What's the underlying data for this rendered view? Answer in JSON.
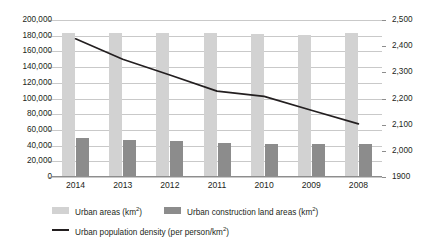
{
  "chart_data": {
    "type": "bar",
    "title": "",
    "xlabel": "",
    "ylabel": "",
    "categories": [
      "2014",
      "2013",
      "2012",
      "2011",
      "2010",
      "2009",
      "2008"
    ],
    "series": [
      {
        "name": "Urban areas (km²)",
        "type": "bar",
        "axis": "left",
        "color": "#d2d2d2",
        "values": [
          183500,
          183500,
          183200,
          183200,
          182600,
          180500,
          183000
        ]
      },
      {
        "name": "Urban construction land areas (km²)",
        "type": "bar",
        "axis": "left",
        "color": "#8c8c8c",
        "values": [
          49800,
          47000,
          45600,
          43100,
          41700,
          41600,
          41800
        ]
      },
      {
        "name": "Urban population density (per person/km²)",
        "type": "line",
        "axis": "right",
        "color": "#231f20",
        "values": [
          2428,
          2350,
          2290,
          2228,
          2208,
          2155,
          2103
        ]
      }
    ],
    "left_axis": {
      "min": 0,
      "max": 200000,
      "step": 20000,
      "ticks": [
        "0",
        "20,000",
        "40,000",
        "60,000",
        "80,000",
        "100,000",
        "120,000",
        "140,000",
        "160,000",
        "180,000",
        "200,000"
      ]
    },
    "right_axis": {
      "min": 1900,
      "max": 2500,
      "step": 100,
      "ticks": [
        "1900",
        "2,000",
        "2,100",
        "2,200",
        "2,300",
        "2,400",
        "2,500"
      ]
    },
    "grid": true,
    "legend_position": "bottom-left"
  },
  "legend": {
    "items": [
      {
        "label_main": "Urban areas (km",
        "label_sup": "2",
        "label_tail": ")",
        "marker": "bar-light"
      },
      {
        "label_main": "Urban construction land areas (km",
        "label_sup": "2",
        "label_tail": ")",
        "marker": "bar-dark"
      },
      {
        "label_main": "Urban population density (per person/km",
        "label_sup": "2",
        "label_tail": ")",
        "marker": "line"
      }
    ]
  }
}
